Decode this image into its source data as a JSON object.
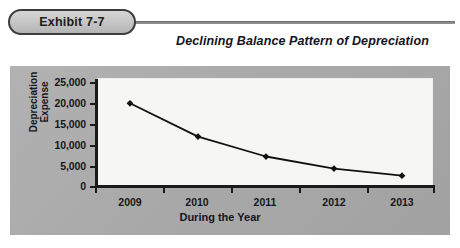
{
  "header": {
    "exhibit_badge": "Exhibit 7-7",
    "caption": "Declining Balance Pattern of Depreciation"
  },
  "colors": {
    "panel_bg": "#aaaaaa",
    "plot_bg": "#f6f6f4",
    "axis": "#1a1a1a",
    "series_line": "#111111",
    "marker": "#111111",
    "badge_fill": "#c8c8c8",
    "badge_border": "#3c3c3c",
    "text": "#16161c"
  },
  "chart_data": {
    "type": "line",
    "title": "Declining Balance Pattern of Depreciation",
    "xlabel": "During the Year",
    "ylabel": "Depreciation Expense",
    "ylabel_lines": [
      "Depreciation",
      "Expense"
    ],
    "categories": [
      "2009",
      "2010",
      "2011",
      "2012",
      "2013"
    ],
    "values": [
      20000,
      12000,
      7200,
      4300,
      2600
    ],
    "series": [
      {
        "name": "Depreciation Expense",
        "values": [
          20000,
          12000,
          7200,
          4300,
          2600
        ]
      }
    ],
    "ylim": [
      0,
      25000
    ],
    "ytick_labels": [
      "25,000",
      "20,000",
      "15,000",
      "10,000",
      "5,000",
      "0"
    ],
    "ytick_values": [
      25000,
      20000,
      15000,
      10000,
      5000,
      0
    ],
    "grid": false,
    "legend": false,
    "legend_position": "none",
    "marker": "diamond"
  }
}
